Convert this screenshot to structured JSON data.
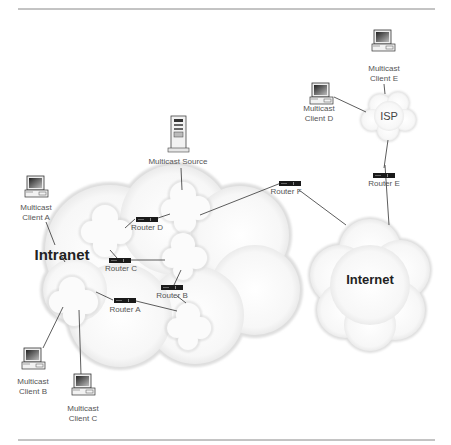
{
  "diagram": {
    "type": "multicast network topology",
    "clouds": {
      "intranet": "Intranet",
      "internet": "Internet",
      "isp": "ISP"
    },
    "source": {
      "line1": "Multicast Source"
    },
    "clients": {
      "a": {
        "line1": "Multicast",
        "line2": "Client A"
      },
      "b": {
        "line1": "Multicast",
        "line2": "Client B"
      },
      "c": {
        "line1": "Multicast",
        "line2": "Client C"
      },
      "d": {
        "line1": "Multicast",
        "line2": "Client D"
      },
      "e": {
        "line1": "Multicast",
        "line2": "Client E"
      }
    },
    "routers": {
      "a": "Router A",
      "b": "Router B",
      "c": "Router C",
      "d": "Router D",
      "e": "Router E",
      "f": "Router F"
    },
    "colors": {
      "line": "#333333",
      "cloud_fill": "#f4f4f4",
      "cloud_edge": "#d8d8d8",
      "router": "#1a1a1a",
      "rule": "#888888"
    }
  }
}
